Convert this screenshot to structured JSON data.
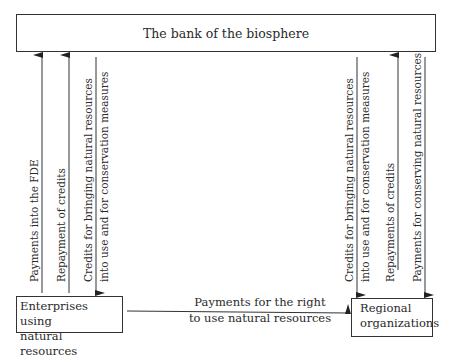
{
  "diagram": {
    "bank": {
      "label": "The bank of the biosphere"
    },
    "enterprises": {
      "line1": "Enterprises using",
      "line2": "natural resources"
    },
    "regional": {
      "line1": "Regional",
      "line2": "organizations"
    },
    "flows": {
      "payments_fde": "Payments into the FDE",
      "repayment_left": "Repayment of credits",
      "credits_left_1": "Credits for bringing natural resources",
      "credits_left_2": "into use and for conservation measures",
      "credits_right_1": "Credits for bringing natural resources",
      "credits_right_2": "into use and for conservation measures",
      "repayments_right": "Repayments of credits",
      "payments_conserving": "Payments for conserving natural resources",
      "payments_right_1": "Payments for the right",
      "payments_right_2": "to use natural resources"
    }
  }
}
